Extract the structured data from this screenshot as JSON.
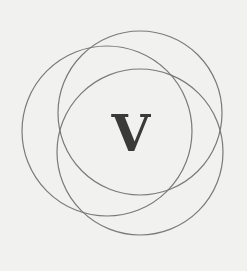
{
  "logo": {
    "letter": "V",
    "letter_color": "#3a3a3a",
    "stroke_color": "#7a7a7a",
    "background_color": "#f1f1ef",
    "circles": [
      {
        "name": "top-right-circle",
        "cx": 140,
        "cy": 113,
        "r": 82
      },
      {
        "name": "left-circle",
        "cx": 107,
        "cy": 131,
        "r": 85
      },
      {
        "name": "bottom-right-circle",
        "cx": 140,
        "cy": 152,
        "r": 83
      }
    ]
  }
}
